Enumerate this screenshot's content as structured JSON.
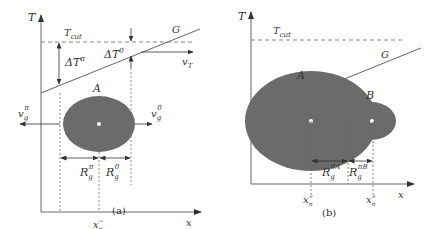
{
  "panel_a": {
    "caption": "(a)",
    "axis_y_label": "T",
    "axis_x_label": "x",
    "tcut_label": "T",
    "tcut_sub": "cut",
    "gradient_label": "G",
    "delta_t_pi_label": "ΔT",
    "delta_t_pi_sup": "π",
    "delta_t_0_label": "ΔT",
    "delta_t_0_sup": "0",
    "vt_label": "v",
    "vt_sub": "T",
    "grain_label": "A",
    "vg_pi_label": "v",
    "vg_pi_sub": "g",
    "vg_pi_sup": "π",
    "vg_0_label": "v",
    "vg_0_sub": "g",
    "vg_0_sup": "0",
    "r_pi_label": "R",
    "r_pi_sub": "g",
    "r_pi_sup": "π",
    "r_0_label": "R",
    "r_0_sub": "g",
    "r_0_sup": "0",
    "xn_label": "x",
    "xn_sub": "n",
    "xn_sup": "−"
  },
  "panel_b": {
    "caption": "(b)",
    "axis_y_label": "T",
    "axis_x_label": "x",
    "tcut_label": "T",
    "tcut_sub": "cut",
    "gradient_label": "G",
    "grain_a_label": "A",
    "grain_b_label": "B",
    "r_0a_label": "R",
    "r_0a_sub": "g",
    "r_0a_sup": "0A",
    "r_pib_label": "R",
    "r_pib_sub": "g",
    "r_pib_sup": "πB",
    "xn_minus_label": "x",
    "xn_minus_sub": "n",
    "xn_minus_sup": "−",
    "xn_plus_label": "x",
    "xn_plus_sub": "n",
    "xn_plus_sup": "+"
  },
  "colors": {
    "grain_fill": "#6b6b6b",
    "line": "#555555",
    "axis": "#666666"
  }
}
